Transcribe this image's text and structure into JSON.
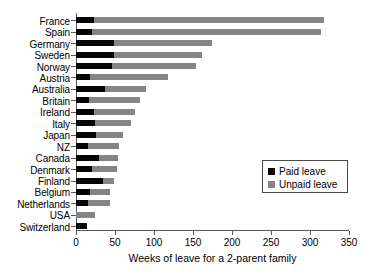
{
  "chart_data": {
    "type": "bar",
    "orientation": "horizontal",
    "stacked": true,
    "title": "",
    "xlabel": "Weeks of leave for a 2-parent family",
    "ylabel": "",
    "xlim": [
      0,
      350
    ],
    "xticks": [
      0,
      50,
      100,
      150,
      200,
      250,
      300,
      350
    ],
    "xtick_labels": [
      "0",
      "50",
      "100",
      "150",
      "200",
      "250",
      "300",
      "350"
    ],
    "grid": false,
    "legend_position": "center-right",
    "categories": [
      "France",
      "Spain",
      "Germany",
      "Sweden",
      "Norway",
      "Austria",
      "Australia",
      "Britain",
      "Ireland",
      "Italy",
      "Japan",
      "NZ",
      "Canada",
      "Denmark",
      "Finland",
      "Belgium",
      "Netherlands",
      "USA",
      "Switzerland"
    ],
    "series": [
      {
        "name": "Paid leave",
        "color": "#050505",
        "values": [
          23,
          20,
          49,
          49,
          46,
          18,
          37,
          17,
          23,
          24,
          26,
          16,
          29,
          21,
          34,
          18,
          16,
          0,
          14
        ]
      },
      {
        "name": "Unpaid leave",
        "color": "#858588",
        "values": [
          295,
          294,
          126,
          113,
          108,
          100,
          53,
          65,
          53,
          46,
          34,
          39,
          25,
          31,
          15,
          26,
          28,
          24,
          0
        ]
      }
    ],
    "totals": [
      318,
      314,
      175,
      162,
      154,
      118,
      90,
      82,
      76,
      70,
      60,
      55,
      54,
      52,
      49,
      44,
      44,
      24,
      14
    ]
  },
  "legend": {
    "entries": [
      {
        "label": "Paid leave",
        "color": "#050505"
      },
      {
        "label": "Unpaid leave",
        "color": "#858588"
      }
    ]
  }
}
